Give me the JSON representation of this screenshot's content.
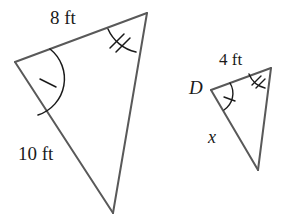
{
  "figure": {
    "stroke_color": "#595959",
    "mark_color": "#1a1a1a",
    "background_color": "#ffffff",
    "stroke_width": 2,
    "mark_stroke_width": 1.4
  },
  "triangles": [
    {
      "id": "large-triangle",
      "name": "large-triangle",
      "vertices": [
        {
          "name": "left-vertex",
          "x": 15,
          "y": 62
        },
        {
          "name": "top-right-vertex",
          "x": 147,
          "y": 13
        },
        {
          "name": "bottom-vertex",
          "x": 113,
          "y": 213
        }
      ],
      "side_labels": [
        {
          "name": "top-side-length",
          "text": "8 ft",
          "x": 50,
          "y": 8
        },
        {
          "name": "left-side-length",
          "text": "10 ft",
          "x": 18,
          "y": 144
        }
      ],
      "angle_marks": [
        {
          "name": "single-tick-angle-mark",
          "vertex": "left-vertex",
          "ticks": 1
        },
        {
          "name": "double-tick-angle-mark",
          "vertex": "top-right-vertex",
          "ticks": 2
        }
      ]
    },
    {
      "id": "small-triangle",
      "name": "small-triangle",
      "vertices": [
        {
          "name": "vertex-d",
          "x": 211,
          "y": 90
        },
        {
          "name": "top-right-vertex",
          "x": 271,
          "y": 68
        },
        {
          "name": "bottom-vertex",
          "x": 258,
          "y": 170
        }
      ],
      "vertex_labels": [
        {
          "name": "vertex-label-d",
          "text": "D",
          "x": 189,
          "y": 78
        }
      ],
      "side_labels": [
        {
          "name": "top-side-length",
          "text": "4 ft",
          "x": 219,
          "y": 51
        },
        {
          "name": "left-side-unknown",
          "text": "x",
          "x": 208,
          "y": 128
        }
      ],
      "angle_marks": [
        {
          "name": "single-tick-angle-mark",
          "vertex": "vertex-d",
          "ticks": 1
        },
        {
          "name": "double-tick-angle-mark",
          "vertex": "top-right-vertex",
          "ticks": 2
        }
      ]
    }
  ],
  "labels": {
    "big_top": "8 ft",
    "big_left": "10 ft",
    "small_top": "4 ft",
    "small_left": "x",
    "small_vertex_d": "D"
  }
}
